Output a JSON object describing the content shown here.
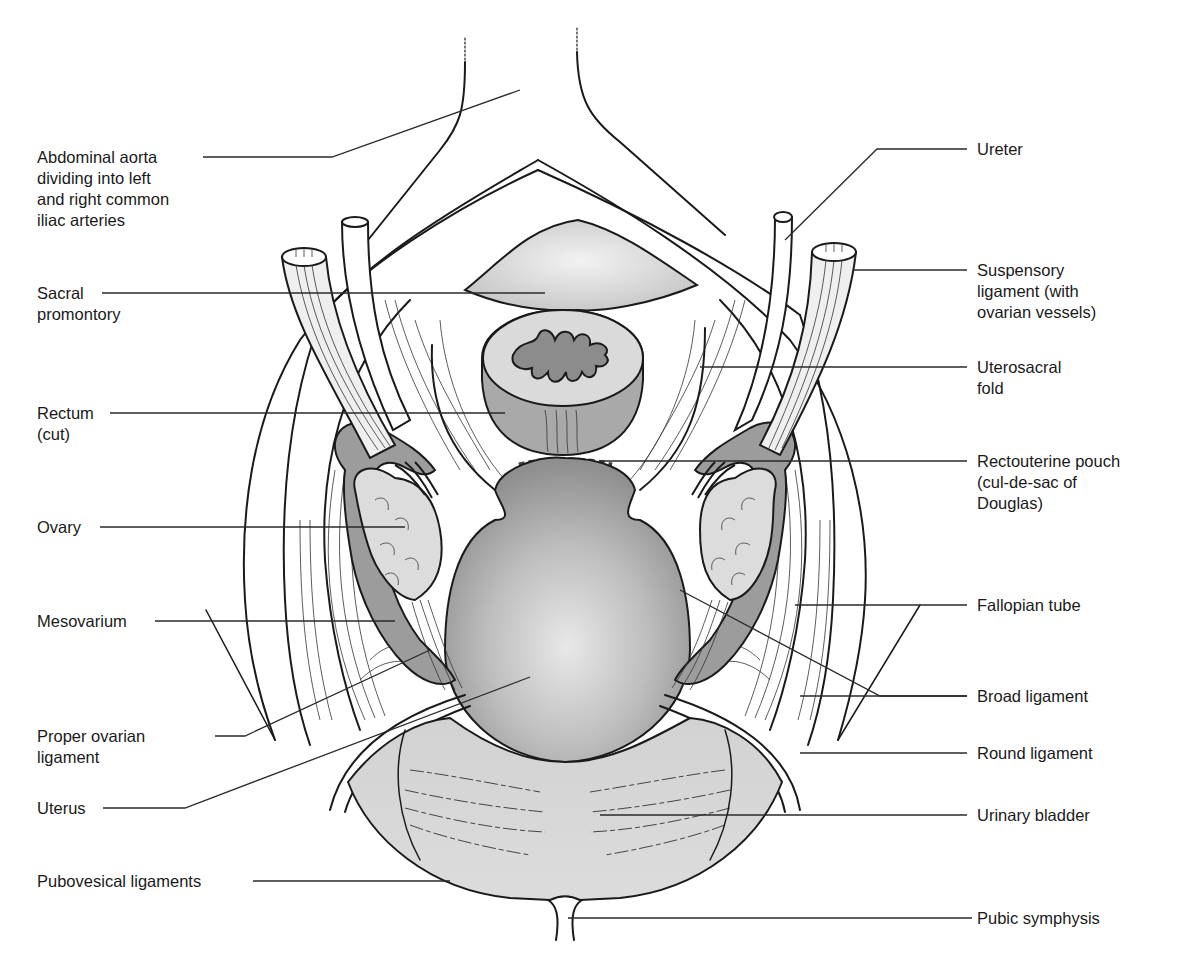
{
  "figure": {
    "colors": {
      "ink": "#1a1a1a",
      "light_gray": "#d9d9d9",
      "mid_gray": "#a8a8a8",
      "dark_gray": "#8a8a8a",
      "background": "#ffffff"
    }
  },
  "labels": {
    "left": [
      {
        "id": "abdominal-aorta",
        "text": "Abdominal aorta\ndividing into left\nand right common\niliac arteries"
      },
      {
        "id": "sacral-promontory",
        "text": "Sacral\npromontory"
      },
      {
        "id": "rectum",
        "text": "Rectum\n(cut)"
      },
      {
        "id": "ovary",
        "text": "Ovary"
      },
      {
        "id": "mesovarium",
        "text": "Mesovarium"
      },
      {
        "id": "proper-ovarian-ligament",
        "text": "Proper ovarian\nligament"
      },
      {
        "id": "uterus",
        "text": "Uterus"
      },
      {
        "id": "pubovesical-ligaments",
        "text": "Pubovesical ligaments"
      }
    ],
    "right": [
      {
        "id": "ureter",
        "text": "Ureter"
      },
      {
        "id": "suspensory-ligament",
        "text": "Suspensory\nligament (with\novarian vessels)"
      },
      {
        "id": "uterosacral-fold",
        "text": "Uterosacral\nfold"
      },
      {
        "id": "rectouterine-pouch",
        "text": "Rectouterine pouch\n(cul-de-sac of\nDouglas)"
      },
      {
        "id": "fallopian-tube",
        "text": "Fallopian tube"
      },
      {
        "id": "broad-ligament",
        "text": "Broad ligament"
      },
      {
        "id": "round-ligament",
        "text": "Round ligament"
      },
      {
        "id": "urinary-bladder",
        "text": "Urinary bladder"
      },
      {
        "id": "pubic-symphysis",
        "text": "Pubic symphysis"
      }
    ]
  }
}
